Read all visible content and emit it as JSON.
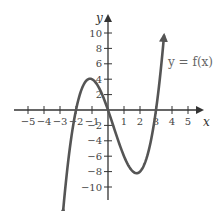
{
  "chart_data": {
    "type": "line",
    "title": "",
    "xlabel": "x",
    "ylabel": "y",
    "xlim": [
      -5.5,
      5.5
    ],
    "ylim": [
      -11,
      11.5
    ],
    "grid": false,
    "x_ticks": [
      -5,
      -4,
      -3,
      -2,
      -1,
      1,
      2,
      3,
      4,
      5
    ],
    "x_tick_labels": [
      "−5",
      "−4",
      "−3",
      "−2",
      "−1",
      "1",
      "2",
      "3",
      "4",
      "5"
    ],
    "y_ticks": [
      10,
      8,
      6,
      4,
      2,
      -2,
      -4,
      -6,
      -8,
      -10
    ],
    "y_tick_labels": [
      "10",
      "8",
      "6",
      "4",
      "2",
      "−2",
      "−4",
      "−6",
      "−8",
      "−10"
    ],
    "series": [
      {
        "name": "y = f(x)",
        "description": "cubic with zeros at x=-2, 0, 3; local max near (-1, 4); local min near (1.8, -8.2)",
        "x": [
          -2.8,
          -2.5,
          -2,
          -1.5,
          -1,
          -0.5,
          0,
          0.5,
          1,
          1.5,
          1.8,
          2,
          2.5,
          3,
          3.3,
          3.5
        ],
        "y": [
          -11.6,
          -6.9,
          0,
          3.4,
          4,
          2.6,
          0,
          -2.6,
          -6,
          -7.9,
          -8.2,
          -8,
          -6.9,
          0,
          4.2,
          9.6
        ]
      }
    ],
    "annotations": [
      {
        "text": "y = f(x)",
        "position": "upper right, next to rising branch"
      }
    ],
    "legend": null
  },
  "labels": {
    "x_axis": "x",
    "y_axis": "y",
    "function": "y = f(x)"
  },
  "colors": {
    "curve": "#555555",
    "axis": "#333333",
    "label": "#444444"
  }
}
